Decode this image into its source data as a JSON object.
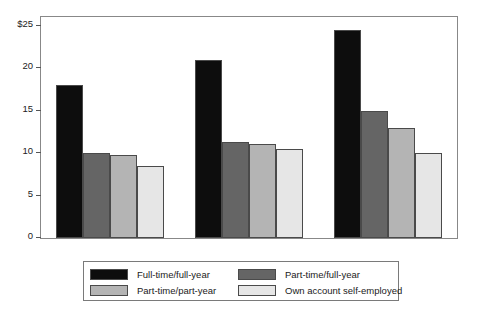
{
  "chart_data": {
    "type": "bar",
    "title": "",
    "subtitle": "",
    "xlabel": "",
    "ylabel": "",
    "categories": [
      "1999",
      "2005",
      "2011"
    ],
    "series": [
      {
        "name": "Full-time/full-year",
        "color": "#0d0d0d",
        "values": [
          18.0,
          21.0,
          24.5
        ]
      },
      {
        "name": "Part-time/full-year",
        "color": "#656565",
        "values": [
          10.0,
          11.3,
          15.0
        ]
      },
      {
        "name": "Part-time/part-year",
        "color": "#b4b4b4",
        "values": [
          9.8,
          11.1,
          13.0
        ]
      },
      {
        "name": "Own account self-employed",
        "color": "#e6e6e6",
        "values": [
          8.5,
          10.5,
          10.0
        ]
      }
    ],
    "ylim": [
      0,
      26
    ],
    "yticks": [
      0,
      5,
      10,
      15,
      20,
      25
    ],
    "ytick_labels": [
      "0",
      "5",
      "10",
      "15",
      "20",
      "$25"
    ],
    "grid": false,
    "legend_position": "bottom"
  },
  "legend": {
    "entries": [
      "Full-time/full-year",
      "Part-time/full-year",
      "Part-time/part-year",
      "Own account self-employed"
    ]
  }
}
